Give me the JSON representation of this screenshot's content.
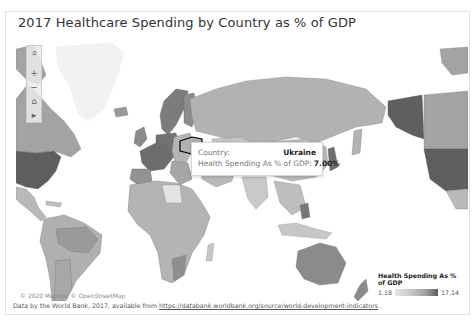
{
  "title": "2017 Healthcare Spending by Country as % of GDP",
  "map": {
    "toolbar": [
      {
        "name": "search-icon",
        "glyph": "⌕"
      },
      {
        "name": "zoom-in-icon",
        "glyph": "+"
      },
      {
        "name": "zoom-out-icon",
        "glyph": "−"
      },
      {
        "name": "home-icon",
        "glyph": "⌂"
      },
      {
        "name": "pan-icon",
        "glyph": "▸"
      }
    ],
    "attribution": "© 2020 Mapbox © OpenStreetMap",
    "colors": {
      "low": "#e6e6e6",
      "mid": "#b5b5b5",
      "high": "#5e5e5e",
      "water": "#ffffff",
      "border": "#777777",
      "highlight": "#000000"
    },
    "highlighted_country": "Ukraine"
  },
  "tooltip": {
    "country_label": "Country:",
    "country_value": "Ukraine",
    "metric_label": "Health Spending As % of GDP:",
    "metric_value": "7.00%"
  },
  "legend": {
    "title": "Health Spending As % of GDP",
    "min": "1.18",
    "max": "17.14"
  },
  "footer": {
    "text": "Data by the World Bank, 2017, available from ",
    "link": "https://databank.worldbank.org/source/world-development-indicators"
  }
}
